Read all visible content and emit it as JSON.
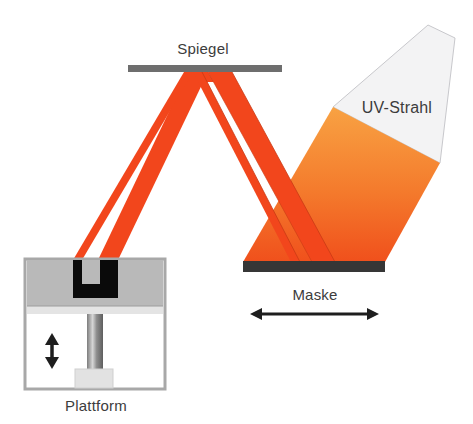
{
  "diagram": {
    "type": "DLP / mask stereolithography schematic",
    "labels": {
      "mirror": "Spiegel",
      "uv_beam": "UV-Strahl",
      "mask": "Maske",
      "platform": "Plattform"
    },
    "colors": {
      "beam_red": "#f2461c",
      "beam_orange_top": "#f7a040",
      "beam_orange_bottom": "#f0501c",
      "uv_light": "#f2f2f3",
      "mirror": "#6e6e6e",
      "mask": "#363636",
      "vat_fill": "#b9b9b9",
      "vat_band": "#e4e4e4",
      "vat_border": "#a8a8a8",
      "part": "#0a0a0a",
      "column": "#9a9a9a",
      "base": "#e2e2e2",
      "arrow": "#1e1e1e",
      "text": "#3c3c3c"
    },
    "arrows": {
      "mask_motion": "horizontal double arrow",
      "platform_motion": "vertical double arrow"
    }
  }
}
